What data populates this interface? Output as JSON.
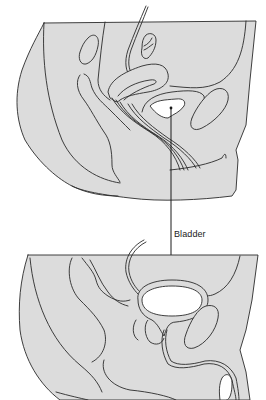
{
  "diagram": {
    "panels": [
      {
        "id": "female-pelvis",
        "position": "top"
      },
      {
        "id": "male-pelvis",
        "position": "bottom"
      }
    ],
    "labels": {
      "bladder": "Bladder"
    },
    "colors": {
      "tissue_fill": "#dcdcdc",
      "outline": "#2a2a2a",
      "cavity_fill": "#ffffff",
      "background": "#ffffff"
    }
  }
}
